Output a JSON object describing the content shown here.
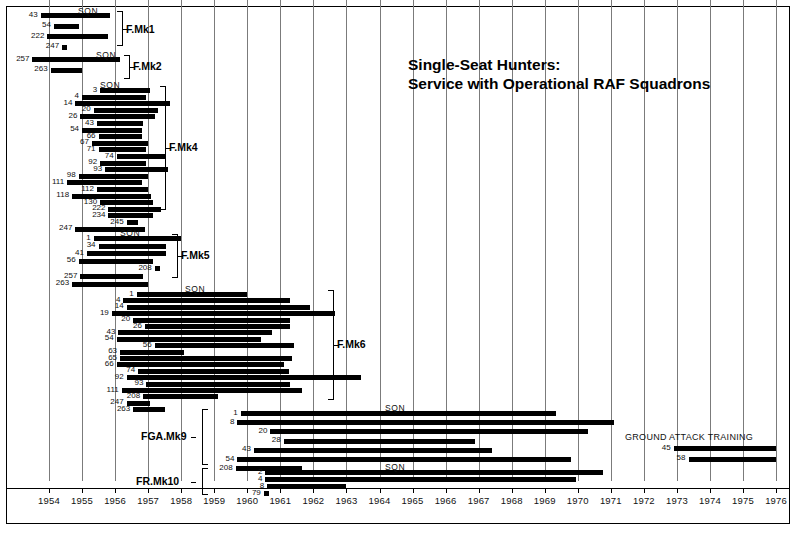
{
  "title": {
    "line1": "Single-Seat Hunters:",
    "line2": "Service with Operational RAF Squadrons"
  },
  "labels": {
    "sqn": "SQN",
    "ground_attack_training": "GROUND ATTACK TRAINING"
  },
  "chart_data": {
    "type": "bar",
    "orientation": "horizontal-gantt",
    "title": "Single-Seat Hunters: Service with Operational RAF Squadrons",
    "xlabel": "",
    "ylabel": "",
    "xlim": [
      1954,
      1976
    ],
    "grid": true,
    "legend": "none",
    "xticks": [
      "1954",
      "1955",
      "1956",
      "1957",
      "1958",
      "1959",
      "1960",
      "1961",
      "1962",
      "1963",
      "1964",
      "1965",
      "1966",
      "1967",
      "1968",
      "1969",
      "1970",
      "1971",
      "1972",
      "1973",
      "1974",
      "1975",
      "1976"
    ],
    "groups": [
      {
        "name": "F.Mk1",
        "sqn_header": "SQN",
        "rows": [
          {
            "sqn": "43",
            "start": 1953.75,
            "end": 1955.85
          },
          {
            "sqn": "54",
            "start": 1954.15,
            "end": 1954.9
          },
          {
            "sqn": "222",
            "start": 1953.95,
            "end": 1955.8
          },
          {
            "sqn": "247",
            "start": 1954.4,
            "end": 1954.55
          }
        ]
      },
      {
        "name": "F.Mk2",
        "sqn_header": "SQN",
        "rows": [
          {
            "sqn": "257",
            "start": 1953.5,
            "end": 1956.15
          },
          {
            "sqn": "263",
            "start": 1954.05,
            "end": 1955.0
          }
        ]
      },
      {
        "name": "F.Mk4",
        "sqn_header": "SQN",
        "rows": [
          {
            "sqn": "3",
            "start": 1955.55,
            "end": 1957.05
          },
          {
            "sqn": "4",
            "start": 1955.0,
            "end": 1956.95
          },
          {
            "sqn": "14",
            "start": 1954.8,
            "end": 1957.65
          },
          {
            "sqn": "20",
            "start": 1955.35,
            "end": 1957.3
          },
          {
            "sqn": "26",
            "start": 1954.95,
            "end": 1957.2
          },
          {
            "sqn": "43",
            "start": 1955.45,
            "end": 1956.85
          },
          {
            "sqn": "54",
            "start": 1955.0,
            "end": 1956.8
          },
          {
            "sqn": "66",
            "start": 1955.5,
            "end": 1956.8
          },
          {
            "sqn": "67",
            "start": 1955.3,
            "end": 1957.0
          },
          {
            "sqn": "71",
            "start": 1955.5,
            "end": 1956.95
          },
          {
            "sqn": "74",
            "start": 1956.05,
            "end": 1957.55
          },
          {
            "sqn": "92",
            "start": 1955.55,
            "end": 1956.95
          },
          {
            "sqn": "93",
            "start": 1955.7,
            "end": 1957.6
          },
          {
            "sqn": "98",
            "start": 1954.9,
            "end": 1957.0
          },
          {
            "sqn": "111",
            "start": 1954.55,
            "end": 1956.8
          },
          {
            "sqn": "112",
            "start": 1955.45,
            "end": 1957.0
          },
          {
            "sqn": "118",
            "start": 1954.7,
            "end": 1957.1
          },
          {
            "sqn": "130",
            "start": 1955.55,
            "end": 1957.15
          },
          {
            "sqn": "222",
            "start": 1955.8,
            "end": 1957.4
          },
          {
            "sqn": "234",
            "start": 1955.8,
            "end": 1957.15
          },
          {
            "sqn": "245",
            "start": 1956.35,
            "end": 1956.7
          },
          {
            "sqn": "247",
            "start": 1954.8,
            "end": 1956.9
          }
        ]
      },
      {
        "name": "F.Mk5",
        "sqn_header": "SQN",
        "rows": [
          {
            "sqn": "1",
            "start": 1955.35,
            "end": 1958.0
          },
          {
            "sqn": "34",
            "start": 1955.5,
            "end": 1957.55
          },
          {
            "sqn": "41",
            "start": 1955.15,
            "end": 1957.55
          },
          {
            "sqn": "56",
            "start": 1954.9,
            "end": 1957.15
          },
          {
            "sqn": "208",
            "start": 1957.2,
            "end": 1957.35
          },
          {
            "sqn": "257",
            "start": 1954.95,
            "end": 1956.85
          },
          {
            "sqn": "263",
            "start": 1954.7,
            "end": 1957.0
          }
        ]
      },
      {
        "name": "F.Mk6",
        "sqn_header": "SQN",
        "rows": [
          {
            "sqn": "1",
            "start": 1956.65,
            "end": 1960.0
          },
          {
            "sqn": "4",
            "start": 1956.25,
            "end": 1961.3
          },
          {
            "sqn": "14",
            "start": 1956.35,
            "end": 1961.9
          },
          {
            "sqn": "19",
            "start": 1955.9,
            "end": 1962.65
          },
          {
            "sqn": "20",
            "start": 1956.55,
            "end": 1961.3
          },
          {
            "sqn": "26",
            "start": 1956.9,
            "end": 1961.3
          },
          {
            "sqn": "43",
            "start": 1956.1,
            "end": 1960.75
          },
          {
            "sqn": "54",
            "start": 1956.05,
            "end": 1960.4
          },
          {
            "sqn": "56",
            "start": 1957.2,
            "end": 1961.4
          },
          {
            "sqn": "63",
            "start": 1956.15,
            "end": 1958.1
          },
          {
            "sqn": "65",
            "start": 1956.15,
            "end": 1961.35
          },
          {
            "sqn": "66",
            "start": 1956.05,
            "end": 1961.1
          },
          {
            "sqn": "74",
            "start": 1956.7,
            "end": 1961.25
          },
          {
            "sqn": "92",
            "start": 1956.35,
            "end": 1963.45
          },
          {
            "sqn": "93",
            "start": 1956.95,
            "end": 1961.3
          },
          {
            "sqn": "111",
            "start": 1956.2,
            "end": 1961.65
          },
          {
            "sqn": "208",
            "start": 1956.85,
            "end": 1959.1
          },
          {
            "sqn": "247",
            "start": 1956.35,
            "end": 1957.05
          },
          {
            "sqn": "263",
            "start": 1956.55,
            "end": 1957.5
          }
        ]
      },
      {
        "name": "FGA.Mk9",
        "sqn_header": "SQN",
        "rows": [
          {
            "sqn": "1",
            "start": 1959.8,
            "end": 1969.35
          },
          {
            "sqn": "8",
            "start": 1959.7,
            "end": 1971.1
          },
          {
            "sqn": "20",
            "start": 1960.7,
            "end": 1970.3
          },
          {
            "sqn": "28",
            "start": 1961.1,
            "end": 1966.9
          },
          {
            "sqn": "43",
            "start": 1960.2,
            "end": 1967.4
          },
          {
            "sqn": "54",
            "start": 1959.7,
            "end": 1969.8
          },
          {
            "sqn": "208",
            "start": 1959.65,
            "end": 1961.65
          }
        ]
      },
      {
        "name": "FR.Mk10",
        "sqn_header": "SQN",
        "rows": [
          {
            "sqn": "2",
            "start": 1960.55,
            "end": 1970.75
          },
          {
            "sqn": "4",
            "start": 1960.55,
            "end": 1969.95
          },
          {
            "sqn": "8",
            "start": 1960.6,
            "end": 1963.0
          },
          {
            "sqn": "79",
            "start": 1960.5,
            "end": 1960.65
          }
        ]
      },
      {
        "name": "GROUND ATTACK TRAINING",
        "sqn_header": "",
        "rows": [
          {
            "sqn": "45",
            "start": 1972.9,
            "end": 1976.0
          },
          {
            "sqn": "58",
            "start": 1973.35,
            "end": 1976.0
          }
        ]
      }
    ]
  }
}
